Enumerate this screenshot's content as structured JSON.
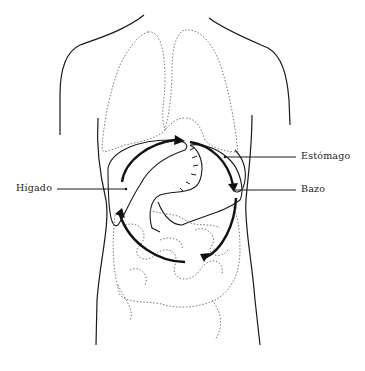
{
  "diagram": {
    "labels": {
      "liver": "Hígado",
      "stomach": "Estómago",
      "spleen": "Bazo"
    },
    "colors": {
      "outline": "#1a1a1a",
      "dotted_organs": "#777777",
      "background": "#ffffff"
    }
  }
}
